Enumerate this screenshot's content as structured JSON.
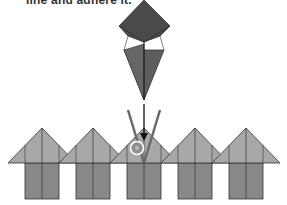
{
  "caption": "line and adhere it.",
  "colors": {
    "kite_top": "#4a4a4a",
    "kite_bottom": "#5e5e5e",
    "roof": "#a8a8a8",
    "body": "#888888",
    "stroke": "#333333",
    "guide_line": "#6a6a6a",
    "arrow": "#111111",
    "glue_ring": "#ffffff",
    "glue_fill": "#8f8f8f"
  },
  "units": [
    {
      "cx": 42
    },
    {
      "cx": 93
    },
    {
      "cx": 144
    },
    {
      "cx": 195
    },
    {
      "cx": 246
    }
  ],
  "glue_marker": {
    "label": "glue-marker"
  }
}
